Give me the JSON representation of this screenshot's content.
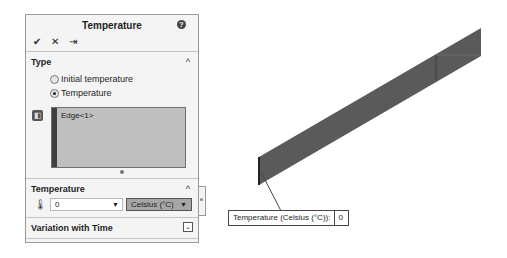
{
  "panel": {
    "title": "Temperature",
    "help_icon": "help-icon",
    "actions": [
      {
        "name": "ok",
        "glyph": "✔"
      },
      {
        "name": "cancel",
        "glyph": "✕"
      },
      {
        "name": "pin",
        "glyph": "⇥"
      }
    ],
    "type_section": {
      "title": "Type",
      "collapse_glyph": "^",
      "options": [
        {
          "label": "Initial temperature",
          "selected": false
        },
        {
          "label": "Temperature",
          "selected": true
        }
      ],
      "selection_items": [
        "Edge<1>"
      ]
    },
    "temperature_section": {
      "title": "Temperature",
      "collapse_glyph": "^",
      "value": "0",
      "unit": "Celsius (°C)",
      "dropdown_glyph": "▼"
    },
    "variation_section": {
      "title": "Variation with Time",
      "expand_glyph": "⌄"
    }
  },
  "viewport": {
    "callout": {
      "label": "Temperature (Celsius (°C)):",
      "value": "0"
    },
    "colors": {
      "beam": "#595959",
      "beam_edge": "#333333"
    }
  }
}
